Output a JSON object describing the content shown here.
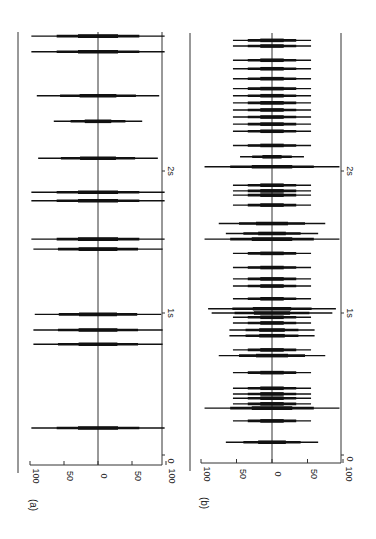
{
  "figure": {
    "panels": [
      {
        "id": "a",
        "label": "(a)"
      },
      {
        "id": "b",
        "label": "(b)"
      }
    ]
  },
  "chart_data": [
    {
      "type": "line",
      "panel": "(a)",
      "title": "",
      "xlabel": "time",
      "ylabel": "amplitude",
      "x_ticks": [
        "0",
        "1s",
        "2s"
      ],
      "y_ticks": [
        "100",
        "50",
        "0",
        "50",
        "100"
      ],
      "ylim": [
        -100,
        100
      ],
      "xlim_s": [
        0,
        2.98
      ],
      "orientation": "rotated 90 degrees; time runs bottom-to-top, amplitude horizontal",
      "events": [
        {
          "t": 0.19,
          "amp": 98
        },
        {
          "t": 0.78,
          "amp": 95
        },
        {
          "t": 0.88,
          "amp": 95
        },
        {
          "t": 0.99,
          "amp": 93
        },
        {
          "t": 1.45,
          "amp": 95
        },
        {
          "t": 1.52,
          "amp": 98
        },
        {
          "t": 1.79,
          "amp": 98
        },
        {
          "t": 1.85,
          "amp": 98
        },
        {
          "t": 2.09,
          "amp": 88
        },
        {
          "t": 2.35,
          "amp": 65
        },
        {
          "t": 2.53,
          "amp": 90
        },
        {
          "t": 2.84,
          "amp": 98
        },
        {
          "t": 2.95,
          "amp": 98
        }
      ]
    },
    {
      "type": "line",
      "panel": "(b)",
      "title": "",
      "xlabel": "time",
      "ylabel": "amplitude",
      "x_ticks": [
        "0",
        "1s",
        "2s"
      ],
      "y_ticks": [
        "100",
        "50",
        "0",
        "50",
        "100"
      ],
      "ylim": [
        -100,
        100
      ],
      "xlim_s": [
        0,
        2.98
      ],
      "orientation": "rotated 90 degrees; time runs bottom-to-top, amplitude horizontal",
      "events": [
        {
          "t": 0.09,
          "amp": 65
        },
        {
          "t": 0.24,
          "amp": 55
        },
        {
          "t": 0.33,
          "amp": 95
        },
        {
          "t": 0.36,
          "amp": 55
        },
        {
          "t": 0.4,
          "amp": 55
        },
        {
          "t": 0.43,
          "amp": 55
        },
        {
          "t": 0.47,
          "amp": 55
        },
        {
          "t": 0.58,
          "amp": 55
        },
        {
          "t": 0.7,
          "amp": 75
        },
        {
          "t": 0.74,
          "amp": 55
        },
        {
          "t": 0.84,
          "amp": 60
        },
        {
          "t": 0.88,
          "amp": 60
        },
        {
          "t": 0.93,
          "amp": 55
        },
        {
          "t": 0.97,
          "amp": 55
        },
        {
          "t": 1.0,
          "amp": 85
        },
        {
          "t": 1.03,
          "amp": 90
        },
        {
          "t": 1.1,
          "amp": 55
        },
        {
          "t": 1.19,
          "amp": 55
        },
        {
          "t": 1.24,
          "amp": 55
        },
        {
          "t": 1.32,
          "amp": 55
        },
        {
          "t": 1.42,
          "amp": 55
        },
        {
          "t": 1.52,
          "amp": 95
        },
        {
          "t": 1.56,
          "amp": 65
        },
        {
          "t": 1.63,
          "amp": 75
        },
        {
          "t": 1.76,
          "amp": 55
        },
        {
          "t": 1.83,
          "amp": 55
        },
        {
          "t": 1.86,
          "amp": 55
        },
        {
          "t": 1.9,
          "amp": 55
        },
        {
          "t": 2.03,
          "amp": 95
        },
        {
          "t": 2.1,
          "amp": 45
        },
        {
          "t": 2.18,
          "amp": 55
        },
        {
          "t": 2.28,
          "amp": 55
        },
        {
          "t": 2.33,
          "amp": 55
        },
        {
          "t": 2.38,
          "amp": 55
        },
        {
          "t": 2.43,
          "amp": 55
        },
        {
          "t": 2.48,
          "amp": 55
        },
        {
          "t": 2.53,
          "amp": 55
        },
        {
          "t": 2.58,
          "amp": 55
        },
        {
          "t": 2.65,
          "amp": 55
        },
        {
          "t": 2.72,
          "amp": 55
        },
        {
          "t": 2.78,
          "amp": 55
        },
        {
          "t": 2.88,
          "amp": 55
        },
        {
          "t": 2.92,
          "amp": 55
        }
      ]
    }
  ],
  "layout": {
    "panels": [
      {
        "left_border_x": 18,
        "right_axis_x": 162,
        "center_x": 98,
        "half_width": 68,
        "axis_y": 465,
        "top_y": 32,
        "t0_y": 455,
        "px_per_s": 142,
        "tick_label_y": 476,
        "panel_label_y": 505,
        "panel_label_x": 30,
        "zero_label_x": 173
      },
      {
        "left_border_x": 190,
        "right_axis_x": 341,
        "center_x": 272,
        "half_width": 71,
        "axis_y": 463,
        "top_y": 33,
        "t0_y": 455,
        "px_per_s": 142,
        "tick_label_y": 474,
        "panel_label_y": 503,
        "panel_label_x": 201,
        "zero_label_x": 350
      }
    ]
  }
}
